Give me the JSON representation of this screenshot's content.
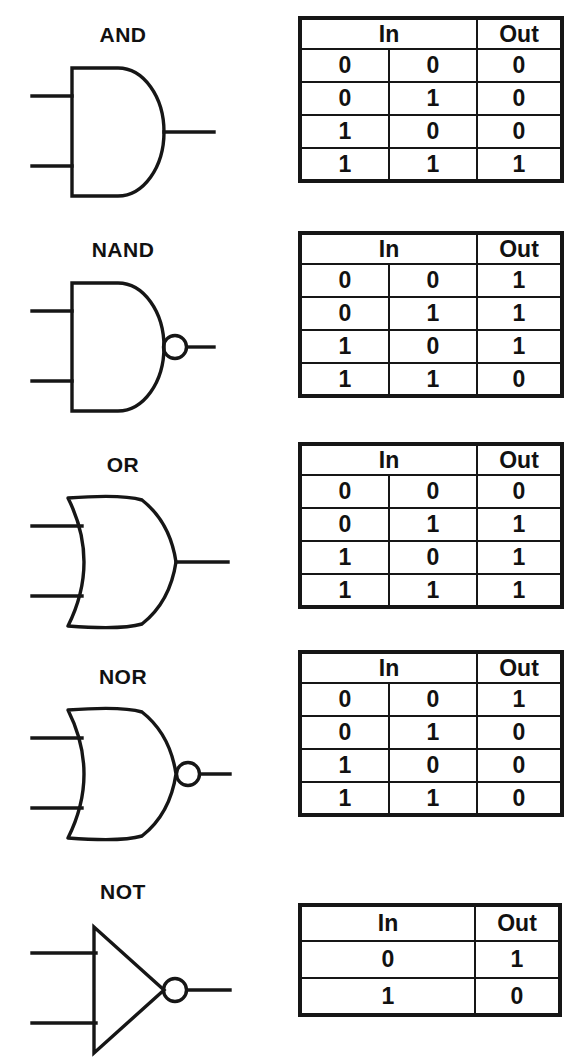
{
  "figure": {
    "ink_color": "#161616",
    "background_color": "#ffffff"
  },
  "columns": {
    "in_header": "In",
    "out_header": "Out"
  },
  "gates": [
    {
      "name": "AND",
      "symbol": "and-gate-symbol",
      "inverted": false,
      "inputs": 2,
      "headers": [
        "In",
        "Out"
      ],
      "rows": [
        [
          "0",
          "0",
          "0"
        ],
        [
          "0",
          "1",
          "0"
        ],
        [
          "1",
          "0",
          "0"
        ],
        [
          "1",
          "1",
          "1"
        ]
      ]
    },
    {
      "name": "NAND",
      "symbol": "nand-gate-symbol",
      "inverted": true,
      "inputs": 2,
      "headers": [
        "In",
        "Out"
      ],
      "rows": [
        [
          "0",
          "0",
          "1"
        ],
        [
          "0",
          "1",
          "1"
        ],
        [
          "1",
          "0",
          "1"
        ],
        [
          "1",
          "1",
          "0"
        ]
      ]
    },
    {
      "name": "OR",
      "symbol": "or-gate-symbol",
      "inverted": false,
      "inputs": 2,
      "headers": [
        "In",
        "Out"
      ],
      "rows": [
        [
          "0",
          "0",
          "0"
        ],
        [
          "0",
          "1",
          "1"
        ],
        [
          "1",
          "0",
          "1"
        ],
        [
          "1",
          "1",
          "1"
        ]
      ]
    },
    {
      "name": "NOR",
      "symbol": "nor-gate-symbol",
      "inverted": true,
      "inputs": 2,
      "headers": [
        "In",
        "Out"
      ],
      "rows": [
        [
          "0",
          "0",
          "1"
        ],
        [
          "0",
          "1",
          "0"
        ],
        [
          "1",
          "0",
          "0"
        ],
        [
          "1",
          "1",
          "0"
        ]
      ]
    },
    {
      "name": "NOT",
      "symbol": "not-gate-symbol",
      "inverted": true,
      "inputs": 1,
      "headers": [
        "In",
        "Out"
      ],
      "rows": [
        [
          "0",
          "1"
        ],
        [
          "1",
          "0"
        ]
      ]
    }
  ]
}
